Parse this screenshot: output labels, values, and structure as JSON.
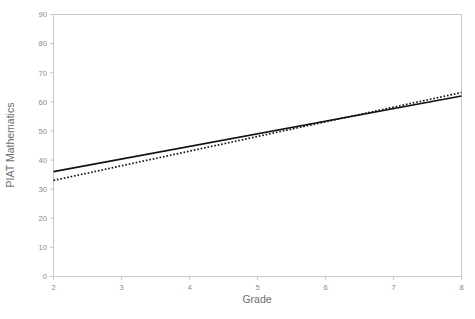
{
  "chart_data": {
    "type": "line",
    "title": "",
    "xlabel": "Grade",
    "ylabel": "PIAT Mathematics",
    "xlim": [
      2,
      8
    ],
    "ylim": [
      0,
      90
    ],
    "xticks": [
      2,
      3,
      4,
      5,
      6,
      7,
      8
    ],
    "xtick_labels": [
      "2",
      "3",
      "4",
      "5",
      "6",
      "7",
      "8"
    ],
    "yticks": [
      0,
      10,
      20,
      30,
      40,
      50,
      60,
      70,
      80,
      90
    ],
    "ytick_labels": [
      "0",
      "10",
      "20",
      "30",
      "40",
      "50",
      "60",
      "70",
      "80",
      "90"
    ],
    "grid": false,
    "legend": "none",
    "x": [
      2,
      8
    ],
    "series": [
      {
        "name": "solid-line",
        "style": "solid",
        "color": "#111111",
        "values": [
          36.0,
          62.0
        ]
      },
      {
        "name": "dotted-line",
        "style": "dotted",
        "color": "#111111",
        "values": [
          33.0,
          63.2
        ]
      }
    ]
  },
  "axis": {
    "x_label": "Grade",
    "y_label": "PIAT Mathematics"
  }
}
